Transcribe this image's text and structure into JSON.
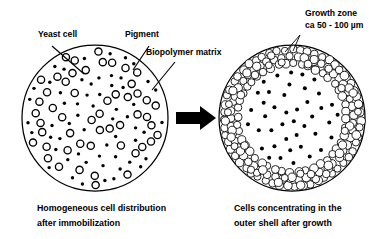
{
  "figure": {
    "title_semantic": "yeast-cell-immobilization-bead-diagram",
    "background_color": "#ffffff",
    "ink_color": "#000000",
    "width": 391,
    "height": 239
  },
  "labels": {
    "yeast_cell": "Yeast cell",
    "pigment": "Pigment",
    "biopolymer_matrix": "Biopolymer matrix",
    "growth_zone_line1": "Growth zone",
    "growth_zone_line2": "ca 50 - 100 µm"
  },
  "captions": {
    "left_line1": "Homogeneous cell distribution",
    "left_line2": "after immobilization",
    "right_line1": "Cells concentrating in the",
    "right_line2": "outer shell after growth"
  },
  "arrow": {
    "name": "transformation-arrow",
    "direction": "right",
    "color": "#000000"
  },
  "chart_data": {
    "type": "diagram",
    "panels": [
      {
        "id": "left-bead",
        "name": "homogeneous-distribution-bead",
        "center": [
          95,
          118
        ],
        "radius": 73,
        "description": "Homogeneous cell distribution after immobilization",
        "yeast_cell_count": 52,
        "pigment_dot_count": 58,
        "yeast_cell_radius": 3.6,
        "pigment_dot_radius": 1.7,
        "distribution": "uniform-throughout"
      },
      {
        "id": "right-bead",
        "name": "outer-shell-growth-bead",
        "center": [
          292,
          118
        ],
        "radius": 73,
        "description": "Cells concentrating in the outer shell after growth",
        "shell_outer_radius": 73,
        "shell_inner_radius": 50,
        "shell_cell_radius": 4.0,
        "shell_cell_count": 180,
        "core_pigment_count": 42,
        "pigment_dot_radius": 2.0,
        "distribution": "dense-outer-shell-sparse-core"
      }
    ],
    "leaders": [
      {
        "name": "yeast-cell-leader",
        "from": [
          52,
          46
        ],
        "to": [
          84,
          74
        ]
      },
      {
        "name": "pigment-leader",
        "from": [
          149,
          46
        ],
        "to": [
          133,
          70
        ]
      },
      {
        "name": "biopolymer-matrix-leader",
        "from": [
          175,
          62
        ],
        "to": [
          152,
          90
        ]
      },
      {
        "name": "growth-zone-leader-a",
        "from": [
          300,
          35
        ],
        "to": [
          285,
          52
        ]
      },
      {
        "name": "growth-zone-leader-b",
        "from": [
          300,
          35
        ],
        "to": [
          293,
          51
        ]
      }
    ]
  }
}
